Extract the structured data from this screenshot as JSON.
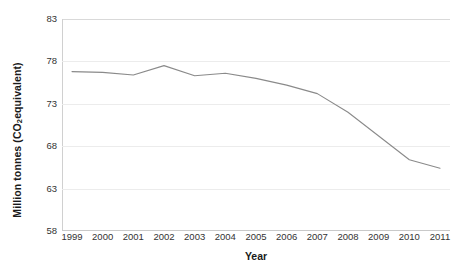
{
  "chart_data": {
    "type": "line",
    "title": "",
    "xlabel": "Year",
    "ylabel": "Million tonnes (CO2 equivalent)",
    "ylabel_parts": {
      "before": "Million tonnes (CO",
      "sub": "2",
      "after": " equivalent)"
    },
    "categories": [
      1999,
      2000,
      2001,
      2002,
      2003,
      2004,
      2005,
      2006,
      2007,
      2008,
      2009,
      2010,
      2011
    ],
    "x_tick_labels": [
      "1999",
      "2000",
      "2001",
      "2002",
      "2003",
      "2004",
      "2005",
      "2006",
      "2007",
      "2008",
      "2009",
      "2010",
      "2011"
    ],
    "values": [
      76.8,
      76.7,
      76.4,
      77.5,
      76.3,
      76.6,
      76.0,
      75.2,
      74.2,
      72.0,
      69.2,
      66.4,
      65.4
    ],
    "y_tick_labels": [
      "83",
      "78",
      "73",
      "68",
      "63",
      "58"
    ],
    "y_ticks": [
      83,
      78,
      73,
      68,
      63,
      58
    ],
    "ylim": [
      58,
      83
    ],
    "xlim": [
      1999,
      2011
    ],
    "grid": true,
    "grid_axis": "y",
    "legend": "none",
    "series_color": "#8a8a8a",
    "gridline_color": "#ececec",
    "axis_color": "#d0d0d0",
    "background": "#ffffff"
  }
}
